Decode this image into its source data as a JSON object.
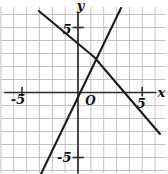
{
  "figure": {
    "kind": "coordinate-plane",
    "background": "#ffffff"
  },
  "chart_data": {
    "type": "line",
    "title": "",
    "xlabel": "x",
    "ylabel": "y",
    "origin_label": "O",
    "xlim": [
      -6,
      7
    ],
    "ylim": [
      -6.3,
      6.6
    ],
    "grid": true,
    "x_ticks": [
      {
        "value": -5,
        "label": "-5"
      },
      {
        "value": 5,
        "label": "5"
      }
    ],
    "y_ticks": [
      {
        "value": -5,
        "label": "-5"
      },
      {
        "value": 5,
        "label": "5"
      }
    ],
    "series": [
      {
        "name": "line-through-origin-slope-2",
        "equation": "y = 2x",
        "slope": 2,
        "y_intercept": 0,
        "points": [
          {
            "x": -2.88,
            "y": -6.27
          },
          {
            "x": 3.35,
            "y": 6.5
          }
        ]
      },
      {
        "name": "line-negative-slope",
        "equation": "y = -x + 3.3",
        "slope": -1,
        "y_intercept": 3.3,
        "x_intercept": 3.3,
        "points": [
          {
            "x": -3.04,
            "y": 6.27
          },
          {
            "x": 1.25,
            "y": 2.73
          },
          {
            "x": 6.38,
            "y": -3.19
          }
        ]
      }
    ],
    "intersection_point": {
      "x": 1.25,
      "y": 2.7
    },
    "legend": null,
    "colors": {
      "grid": "#b4b4b4",
      "axis": "#2b2b2b",
      "line": "#1c1c1c",
      "label": "#111111",
      "background": "#ffffff"
    }
  }
}
